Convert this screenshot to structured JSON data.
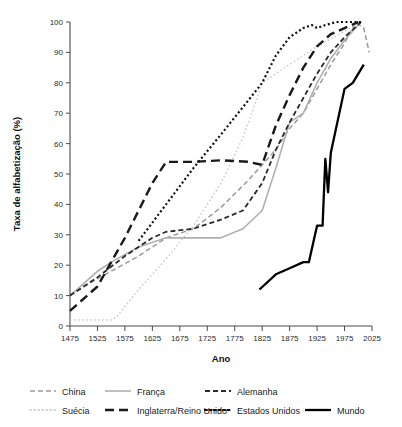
{
  "chart_data": {
    "type": "line",
    "title": "",
    "xlabel": "Ano",
    "ylabel": "Taxa de alfabetização (%)",
    "xlim": [
      1475,
      2025
    ],
    "ylim": [
      0,
      100
    ],
    "xticks": [
      1475,
      1525,
      1575,
      1625,
      1675,
      1725,
      1775,
      1825,
      1875,
      1925,
      1975,
      2025
    ],
    "yticks": [
      0,
      10,
      20,
      30,
      40,
      50,
      60,
      70,
      80,
      90,
      100
    ],
    "grid": false,
    "legend_position": "bottom",
    "series": [
      {
        "name": "China",
        "color": "#9a9a9a",
        "style": "dashed",
        "dasharray": "5,3",
        "width": 1.5,
        "points": [
          [
            1475,
            10
          ],
          [
            1500,
            13
          ],
          [
            1550,
            18
          ],
          [
            1600,
            23
          ],
          [
            1650,
            29
          ],
          [
            1700,
            32
          ],
          [
            1750,
            39
          ],
          [
            1800,
            48
          ],
          [
            1850,
            58
          ],
          [
            1875,
            65
          ],
          [
            1900,
            70
          ],
          [
            1925,
            78
          ],
          [
            1950,
            86
          ],
          [
            1975,
            93
          ],
          [
            1995,
            100
          ],
          [
            2010,
            98
          ],
          [
            2020,
            90
          ]
        ]
      },
      {
        "name": "Suécia",
        "color": "#c9c9c9",
        "style": "dotted",
        "dasharray": "1.5,2.5",
        "width": 1.5,
        "points": [
          [
            1475,
            2
          ],
          [
            1550,
            2
          ],
          [
            1560,
            3
          ],
          [
            1600,
            12
          ],
          [
            1650,
            22
          ],
          [
            1700,
            33
          ],
          [
            1750,
            47
          ],
          [
            1790,
            62
          ],
          [
            1810,
            72
          ],
          [
            1825,
            80
          ],
          [
            1875,
            86
          ],
          [
            1925,
            92
          ],
          [
            1975,
            97
          ],
          [
            2005,
            100
          ]
        ]
      },
      {
        "name": "França",
        "color": "#b0b0b0",
        "style": "solid",
        "dasharray": "",
        "width": 1.6,
        "points": [
          [
            1475,
            10
          ],
          [
            1525,
            18
          ],
          [
            1550,
            21
          ],
          [
            1600,
            26
          ],
          [
            1650,
            29
          ],
          [
            1700,
            29
          ],
          [
            1750,
            29
          ],
          [
            1790,
            32
          ],
          [
            1825,
            38
          ],
          [
            1850,
            52
          ],
          [
            1875,
            67
          ],
          [
            1900,
            70
          ],
          [
            1925,
            80
          ],
          [
            1950,
            88
          ],
          [
            1975,
            94
          ],
          [
            2005,
            100
          ]
        ]
      },
      {
        "name": "Inglaterra/Reino Unido",
        "color": "#1a1a1a",
        "style": "long-dashed",
        "dasharray": "9,5",
        "width": 2.4,
        "points": [
          [
            1475,
            5
          ],
          [
            1525,
            13
          ],
          [
            1575,
            29
          ],
          [
            1625,
            47
          ],
          [
            1650,
            54
          ],
          [
            1700,
            54
          ],
          [
            1750,
            54.5
          ],
          [
            1800,
            54
          ],
          [
            1825,
            53
          ],
          [
            1850,
            66
          ],
          [
            1875,
            76
          ],
          [
            1900,
            85
          ],
          [
            1925,
            92
          ],
          [
            1950,
            96
          ],
          [
            1975,
            98
          ],
          [
            2000,
            100
          ]
        ]
      },
      {
        "name": "Alemanha",
        "color": "#2a2a2a",
        "style": "dashed",
        "dasharray": "5,3",
        "width": 1.8,
        "points": [
          [
            1475,
            10
          ],
          [
            1525,
            16
          ],
          [
            1575,
            23
          ],
          [
            1625,
            29
          ],
          [
            1650,
            31
          ],
          [
            1700,
            32
          ],
          [
            1750,
            35
          ],
          [
            1790,
            38
          ],
          [
            1825,
            47
          ],
          [
            1850,
            58
          ],
          [
            1875,
            67
          ],
          [
            1900,
            75
          ],
          [
            1925,
            83
          ],
          [
            1950,
            90
          ],
          [
            1975,
            95
          ],
          [
            2005,
            100
          ]
        ]
      },
      {
        "name": "Estados Unidos",
        "color": "#111111",
        "style": "dotted",
        "dasharray": "2,2.5",
        "width": 2.2,
        "points": [
          [
            1600,
            28
          ],
          [
            1650,
            40
          ],
          [
            1700,
            52
          ],
          [
            1750,
            63
          ],
          [
            1790,
            72
          ],
          [
            1825,
            80
          ],
          [
            1850,
            89
          ],
          [
            1875,
            95
          ],
          [
            1900,
            98
          ],
          [
            1915,
            99
          ],
          [
            1925,
            98
          ],
          [
            1940,
            99
          ],
          [
            1960,
            100
          ],
          [
            1990,
            100
          ],
          [
            2005,
            100
          ]
        ]
      },
      {
        "name": "Mundo",
        "color": "#000000",
        "style": "solid",
        "dasharray": "",
        "width": 2.3,
        "points": [
          [
            1820,
            12
          ],
          [
            1850,
            17
          ],
          [
            1875,
            19
          ],
          [
            1900,
            21
          ],
          [
            1910,
            21
          ],
          [
            1920,
            29
          ],
          [
            1925,
            33
          ],
          [
            1935,
            33
          ],
          [
            1940,
            55
          ],
          [
            1945,
            44
          ],
          [
            1950,
            57
          ],
          [
            1975,
            78
          ],
          [
            1990,
            80
          ],
          [
            2010,
            86
          ]
        ]
      }
    ]
  },
  "legend": {
    "rows": [
      [
        {
          "label": "China",
          "series": "China"
        },
        {
          "label": "França",
          "series": "França"
        },
        {
          "label": "Alemanha",
          "series": "Alemanha"
        }
      ],
      [
        {
          "label": "Suécia",
          "series": "Suécia"
        },
        {
          "label": "Inglaterra/Reino Unido",
          "series": "Inglaterra/Reino Unido"
        },
        {
          "label": "Estados Unidos",
          "series": "Estados Unidos"
        },
        {
          "label": "Mundo",
          "series": "Mundo"
        }
      ]
    ]
  }
}
